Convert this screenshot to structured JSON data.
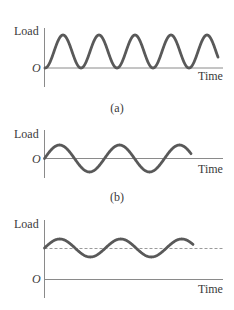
{
  "colors": {
    "wave": "#595959",
    "axis": "#8a8a8a",
    "text": "#3a3a3a",
    "mean_line": "#9a9a9a"
  },
  "panels": [
    {
      "id": "a",
      "caption": "(a)",
      "y_label": "Load",
      "x_label": "Time",
      "origin_label": "O",
      "description": "Fluctuating load between zero and a maximum (zero-to-max cyclic)",
      "axes": {
        "x": 44.5,
        "zero_y": 68,
        "top_y": 28,
        "bottom_y": 87,
        "end_x": 223
      },
      "wave": {
        "kind": "one-minus-cos",
        "base_y": 68,
        "amplitude": 16.5,
        "period": 36,
        "start_x": 45,
        "end_x": 218
      },
      "mean_line": null,
      "text_pos": {
        "load": [
          14,
          35
        ],
        "origin": [
          32,
          72
        ],
        "time": [
          198,
          80
        ],
        "caption": [
          117,
          112
        ]
      }
    },
    {
      "id": "b",
      "caption": "(b)",
      "y_label": "Load",
      "x_label": "Time",
      "origin_label": "O",
      "description": "Fully reversed load (alternating about zero)",
      "axes": {
        "x": 44.5,
        "zero_y": 158.5,
        "top_y": 130,
        "bottom_y": 178,
        "end_x": 223
      },
      "wave": {
        "kind": "sin",
        "base_y": 158.5,
        "amplitude": 13.5,
        "period": 60,
        "start_x": 44.5,
        "end_x": 191
      },
      "mean_line": null,
      "text_pos": {
        "load": [
          14,
          138
        ],
        "origin": [
          32,
          163
        ],
        "time": [
          198,
          173
        ],
        "caption": [
          117,
          201
        ]
      }
    },
    {
      "id": "c",
      "caption": "",
      "y_label": "Load",
      "x_label": "Time",
      "origin_label": "O",
      "description": "Alternating load superimposed on a nonzero mean (dashed mean line)",
      "axes": {
        "x": 44.5,
        "zero_y": 279.5,
        "top_y": 220,
        "bottom_y": 298,
        "end_x": 223
      },
      "wave": {
        "kind": "sin",
        "base_y": 248,
        "amplitude": 9,
        "period": 61,
        "start_x": 44.5,
        "end_x": 193
      },
      "mean_line": {
        "y": 248.5,
        "start_x": 44.5,
        "end_x": 223
      },
      "text_pos": {
        "load": [
          14,
          228
        ],
        "origin": [
          32,
          283
        ],
        "time": [
          198,
          293
        ],
        "caption": [
          117,
          320
        ]
      }
    }
  ]
}
